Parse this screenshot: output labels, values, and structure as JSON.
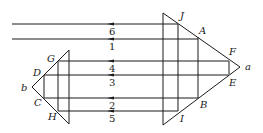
{
  "diagram": {
    "type": "optical-ray-diagram",
    "big_prism": {
      "apex_label": "a",
      "top_points": [
        "J",
        "A",
        "F"
      ],
      "bottom_points": [
        "E",
        "B",
        "I"
      ]
    },
    "small_prism": {
      "apex_label": "b",
      "top_points": [
        "G",
        "D"
      ],
      "bottom_points": [
        "C",
        "H"
      ]
    },
    "ray_labels": {
      "r6": "6",
      "r1": "1",
      "r4": "4",
      "r3": "3",
      "r2": "2",
      "r5": "5"
    },
    "point_labels": {
      "J": "J",
      "A": "A",
      "F": "F",
      "a": "a",
      "E": "E",
      "B": "B",
      "I": "I",
      "G": "G",
      "D": "D",
      "b": "b",
      "C": "C",
      "H": "H"
    },
    "line_color": "#1a1a1a"
  }
}
